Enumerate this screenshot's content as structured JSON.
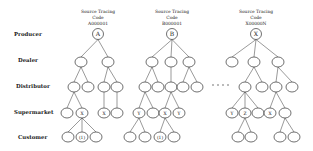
{
  "row_labels": [
    {
      "label": "Producer",
      "y": 36
    },
    {
      "label": "Dealer",
      "y": 62
    },
    {
      "label": "Distributor",
      "y": 88
    },
    {
      "label": "Supermarket",
      "y": 114
    },
    {
      "label": "Customer",
      "y": 139
    }
  ],
  "ellipsis": {
    "y": 85,
    "xs": [
      213,
      218,
      223,
      228
    ]
  },
  "trees": [
    {
      "id": "A",
      "title_lines": [
        "Source Tracing",
        "Code",
        "A000001"
      ],
      "title_x": 98,
      "root": {
        "label": "A",
        "x": 98,
        "y": 34
      },
      "nodes": [
        {
          "id": "a_d1",
          "parent": "root",
          "x": 81,
          "y": 62,
          "label": ""
        },
        {
          "id": "a_d2",
          "parent": "root",
          "x": 108,
          "y": 62,
          "label": ""
        },
        {
          "id": "a_s1",
          "parent": "a_d1",
          "x": 74,
          "y": 87,
          "label": ""
        },
        {
          "id": "a_s2",
          "parent": "a_d1",
          "x": 88,
          "y": 87,
          "label": ""
        },
        {
          "id": "a_s3",
          "parent": "a_d2",
          "x": 104,
          "y": 87,
          "label": ""
        },
        {
          "id": "a_s4",
          "parent": "a_d2",
          "x": 117,
          "y": 87,
          "label": ""
        },
        {
          "id": "a_m1",
          "parent": "a_s1",
          "x": 67,
          "y": 113,
          "label": ""
        },
        {
          "id": "a_m2",
          "parent": "a_s1",
          "x": 82,
          "y": 113,
          "label": "X"
        },
        {
          "id": "a_m3",
          "parent": "a_s3",
          "x": 104,
          "y": 113,
          "label": "X"
        },
        {
          "id": "a_m4",
          "parent": "a_s4",
          "x": 117,
          "y": 113,
          "label": ""
        },
        {
          "id": "a_c1",
          "parent": "a_m2",
          "x": 68,
          "y": 137,
          "label": ""
        },
        {
          "id": "a_c2",
          "parent": "a_m2",
          "x": 82,
          "y": 137,
          "label": "(1)"
        },
        {
          "id": "a_c3",
          "parent": "a_m2",
          "x": 96,
          "y": 137,
          "label": ""
        }
      ]
    },
    {
      "id": "B",
      "title_lines": [
        "Source Tracing",
        "Code",
        "B000001"
      ],
      "title_x": 172,
      "root": {
        "label": "B",
        "x": 172,
        "y": 34
      },
      "nodes": [
        {
          "id": "b_d1",
          "parent": "root",
          "x": 152,
          "y": 62,
          "label": ""
        },
        {
          "id": "b_d2",
          "parent": "root",
          "x": 171,
          "y": 62,
          "label": ""
        },
        {
          "id": "b_d3",
          "parent": "root",
          "x": 189,
          "y": 62,
          "label": ""
        },
        {
          "id": "b_s1",
          "parent": "b_d1",
          "x": 145,
          "y": 87,
          "label": ""
        },
        {
          "id": "b_s2",
          "parent": "b_d1",
          "x": 158,
          "y": 87,
          "label": ""
        },
        {
          "id": "b_s3",
          "parent": "b_d2",
          "x": 171,
          "y": 87,
          "label": ""
        },
        {
          "id": "b_s4",
          "parent": "b_d3",
          "x": 183,
          "y": 87,
          "label": ""
        },
        {
          "id": "b_s5",
          "parent": "b_d3",
          "x": 197,
          "y": 87,
          "label": ""
        },
        {
          "id": "b_m1",
          "parent": "b_s1",
          "x": 139,
          "y": 113,
          "label": "Y"
        },
        {
          "id": "b_m2",
          "parent": "b_s1",
          "x": 153,
          "y": 113,
          "label": ""
        },
        {
          "id": "b_m3",
          "parent": "b_s3",
          "x": 165,
          "y": 113,
          "label": "X"
        },
        {
          "id": "b_m4",
          "parent": "b_s3",
          "x": 179,
          "y": 113,
          "label": "Y"
        },
        {
          "id": "b_c1",
          "parent": "b_m1",
          "x": 130,
          "y": 137,
          "label": ""
        },
        {
          "id": "b_c2",
          "parent": "b_m1",
          "x": 145,
          "y": 137,
          "label": ""
        },
        {
          "id": "b_c3",
          "parent": "b_m3",
          "x": 160,
          "y": 137,
          "label": "(1)"
        },
        {
          "id": "b_c4",
          "parent": "b_m3",
          "x": 174,
          "y": 137,
          "label": ""
        }
      ]
    },
    {
      "id": "X",
      "title_lines": [
        "Source Tracing",
        "Code",
        "X00000N"
      ],
      "title_x": 256,
      "root": {
        "label": "X",
        "x": 256,
        "y": 34
      },
      "nodes": [
        {
          "id": "x_d1",
          "parent": "root",
          "x": 232,
          "y": 62,
          "label": ""
        },
        {
          "id": "x_d2",
          "parent": "root",
          "x": 254,
          "y": 62,
          "label": ""
        },
        {
          "id": "x_d3",
          "parent": "root",
          "x": 278,
          "y": 62,
          "label": ""
        },
        {
          "id": "x_s1",
          "parent": "x_d2",
          "x": 245,
          "y": 87,
          "label": ""
        },
        {
          "id": "x_s2",
          "parent": "x_d2",
          "x": 262,
          "y": 87,
          "label": ""
        },
        {
          "id": "x_s3",
          "parent": "x_d3",
          "x": 276,
          "y": 87,
          "label": ""
        },
        {
          "id": "x_s4",
          "parent": "x_d3",
          "x": 292,
          "y": 87,
          "label": ""
        },
        {
          "id": "x_m1",
          "parent": "x_s1",
          "x": 232,
          "y": 113,
          "label": "Y"
        },
        {
          "id": "x_m2",
          "parent": "x_s1",
          "x": 245,
          "y": 113,
          "label": "Z"
        },
        {
          "id": "x_m3",
          "parent": "x_s1",
          "x": 258,
          "y": 113,
          "label": ""
        },
        {
          "id": "x_m4",
          "parent": "x_s3",
          "x": 270,
          "y": 113,
          "label": "X"
        },
        {
          "id": "x_m5",
          "parent": "x_s3",
          "x": 285,
          "y": 113,
          "label": ""
        },
        {
          "id": "x_c1",
          "parent": "x_m2",
          "x": 238,
          "y": 137,
          "label": ""
        },
        {
          "id": "x_c2",
          "parent": "x_m2",
          "x": 251,
          "y": 137,
          "label": ""
        },
        {
          "id": "x_c3",
          "parent": "x_m5",
          "x": 280,
          "y": 137,
          "label": ""
        },
        {
          "id": "x_c4",
          "parent": "x_m5",
          "x": 294,
          "y": 137,
          "label": ""
        }
      ]
    }
  ]
}
